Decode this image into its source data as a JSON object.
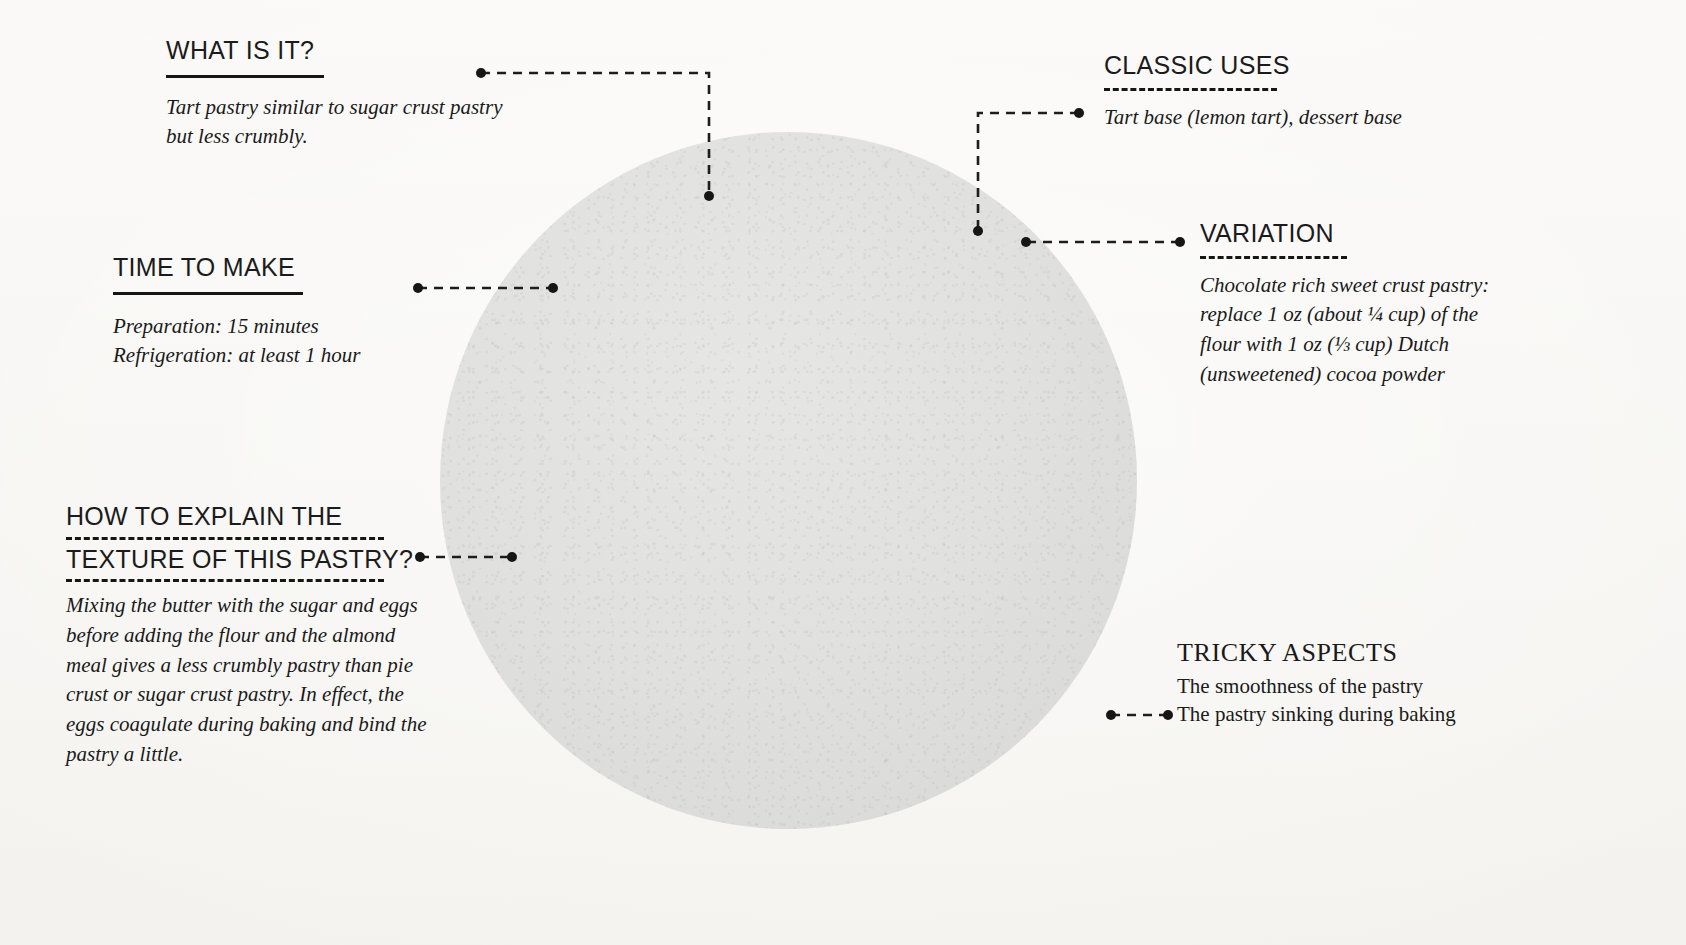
{
  "page": {
    "background_color": "#f7f6f3",
    "circle_color": "#e1e1df"
  },
  "circle": {
    "label": "sweet-crust-pastry-dough-disc"
  },
  "notes": [
    {
      "id": "what-is-it",
      "heading": "WHAT IS IT?",
      "rule": "solid",
      "body": "Tart pastry similar to sugar crust pastry but less crumbly."
    },
    {
      "id": "time-to-make",
      "heading": "TIME TO MAKE",
      "rule": "solid",
      "body_line_1": "Preparation: 15 minutes",
      "body_line_2": "Refrigeration: at least 1 hour"
    },
    {
      "id": "how-to-explain",
      "heading_line_1": "HOW TO EXPLAIN THE",
      "heading_line_2": "TEXTURE OF THIS PASTRY?",
      "rule": "dashed",
      "body": "Mixing the butter with the sugar and eggs before adding the flour and the almond meal gives a less crumbly pastry than pie crust or sugar crust pastry. In effect, the eggs coagulate during baking and bind the pastry a little."
    },
    {
      "id": "classic-uses",
      "heading": "CLASSIC USES",
      "rule": "dashed",
      "body": "Tart base (lemon tart), dessert base"
    },
    {
      "id": "variation",
      "heading": "VARIATION",
      "rule": "dashed",
      "body": "Chocolate rich sweet crust pastry: replace 1 oz (about ¼ cup) of the flour with 1 oz (⅓ cup) Dutch (unsweetened) cocoa powder"
    },
    {
      "id": "tricky-aspects",
      "heading": "TRICKY ASPECTS",
      "rule": "none",
      "body_line_1": "The smoothness of the pastry",
      "body_line_2": "The pastry sinking during baking"
    }
  ],
  "leaders": [
    {
      "name": "leader-what-is-it",
      "path": "M 481,73 H 709 V 196",
      "start_dot": [
        481,
        73
      ],
      "end_dot": [
        709,
        196
      ]
    },
    {
      "name": "leader-time-to-make",
      "path": "M 418,288 H 553",
      "start_dot": [
        418,
        288
      ],
      "end_dot": [
        553,
        288
      ]
    },
    {
      "name": "leader-how-to-explain",
      "path": "M 420,557 H 512",
      "start_dot": [
        420,
        557
      ],
      "end_dot": [
        512,
        557
      ]
    },
    {
      "name": "leader-classic-uses",
      "path": "M 1079,113 H 978 V 231",
      "start_dot": [
        1079,
        113
      ],
      "end_dot": [
        978,
        231
      ]
    },
    {
      "name": "leader-variation",
      "path": "M 1180,242 H 1026",
      "start_dot": [
        1180,
        242
      ],
      "end_dot": [
        1026,
        242
      ]
    },
    {
      "name": "leader-tricky-aspects",
      "path": "M 1168,715 H 1111",
      "start_dot": [
        1168,
        715
      ],
      "end_dot": [
        1111,
        715
      ]
    }
  ]
}
